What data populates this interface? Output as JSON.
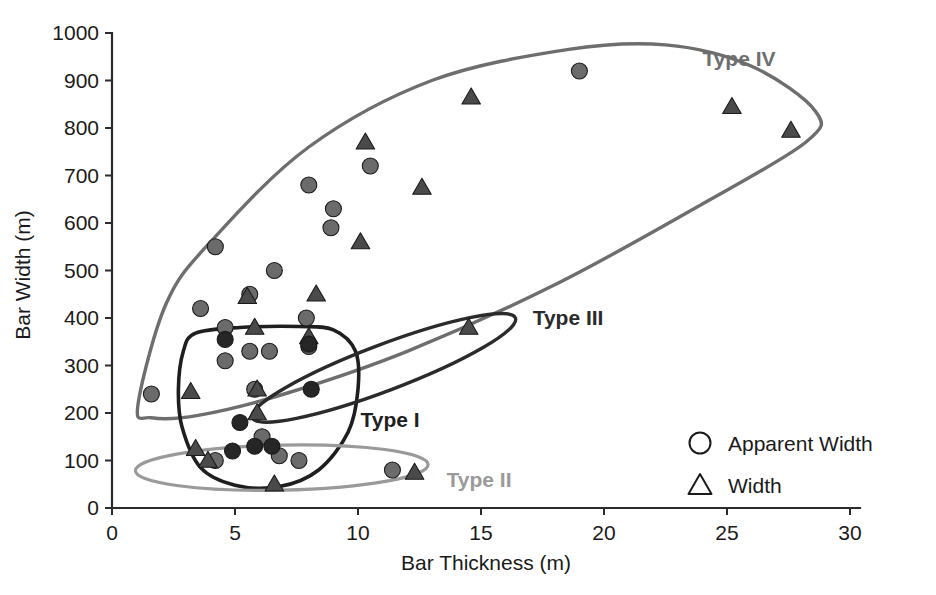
{
  "chart_data": {
    "type": "scatter",
    "title": "",
    "xlabel": "Bar Thickness (m)",
    "ylabel": "Bar Width (m)",
    "xlim": [
      0,
      30
    ],
    "ylim": [
      0,
      1000
    ],
    "xticks": [
      "0",
      "5",
      "10",
      "15",
      "20",
      "25",
      "30"
    ],
    "yticks": [
      "0",
      "100",
      "200",
      "300",
      "400",
      "500",
      "600",
      "700",
      "800",
      "900",
      "1000"
    ],
    "xtick_values": [
      0,
      5,
      10,
      15,
      20,
      25,
      30
    ],
    "ytick_values": [
      0,
      100,
      200,
      300,
      400,
      500,
      600,
      700,
      800,
      900,
      1000
    ],
    "grid": false,
    "legend_position": "lower-right",
    "series": [
      {
        "name": "Apparent Width",
        "marker": "circle",
        "color": "#6b6b6b",
        "points": [
          [
            1.6,
            240
          ],
          [
            4.2,
            550
          ],
          [
            3.6,
            420
          ],
          [
            4.6,
            380
          ],
          [
            5.6,
            450
          ],
          [
            6.6,
            500
          ],
          [
            7.9,
            400
          ],
          [
            8.0,
            340
          ],
          [
            4.6,
            310
          ],
          [
            5.6,
            330
          ],
          [
            6.4,
            330
          ],
          [
            5.8,
            250
          ],
          [
            8.0,
            680
          ],
          [
            9.0,
            630
          ],
          [
            8.9,
            590
          ],
          [
            10.5,
            720
          ],
          [
            6.1,
            150
          ],
          [
            6.8,
            110
          ],
          [
            7.6,
            100
          ],
          [
            11.4,
            80
          ],
          [
            19.0,
            920
          ],
          [
            4.2,
            100
          ]
        ]
      },
      {
        "name": "Width",
        "marker": "triangle",
        "color": "#4a4a4a",
        "points": [
          [
            3.2,
            245
          ],
          [
            5.5,
            445
          ],
          [
            8.3,
            450
          ],
          [
            5.8,
            380
          ],
          [
            10.3,
            770
          ],
          [
            12.6,
            675
          ],
          [
            14.6,
            865
          ],
          [
            25.2,
            845
          ],
          [
            27.6,
            795
          ],
          [
            8.0,
            360
          ],
          [
            14.5,
            380
          ],
          [
            5.9,
            200
          ],
          [
            5.9,
            250
          ],
          [
            3.4,
            125
          ],
          [
            3.9,
            100
          ],
          [
            6.6,
            50
          ],
          [
            12.3,
            75
          ],
          [
            10.1,
            560
          ]
        ]
      },
      {
        "name": "dark-circles",
        "marker": "circle",
        "color": "#262626",
        "points": [
          [
            4.6,
            355
          ],
          [
            8.0,
            345
          ],
          [
            8.1,
            250
          ],
          [
            5.2,
            180
          ],
          [
            5.8,
            130
          ],
          [
            4.9,
            120
          ],
          [
            6.5,
            130
          ]
        ]
      }
    ],
    "groups": [
      {
        "label": "Type I",
        "color": "#1f1f1f",
        "label_x": 10.1,
        "label_y": 185
      },
      {
        "label": "Type II",
        "color": "#9a9a9a",
        "label_x": 13.6,
        "label_y": 60
      },
      {
        "label": "Type III",
        "color": "#2b2b2b",
        "label_x": 17.1,
        "label_y": 400
      },
      {
        "label": "Type IV",
        "color": "#6e6e6e",
        "label_x": 24.0,
        "label_y": 945
      }
    ]
  },
  "legend": {
    "items": [
      {
        "label": "Apparent Width",
        "marker": "circle"
      },
      {
        "label": "Width",
        "marker": "triangle"
      }
    ]
  },
  "axes": {
    "x_title": "Bar Thickness (m)",
    "y_title": "Bar Width (m)"
  }
}
